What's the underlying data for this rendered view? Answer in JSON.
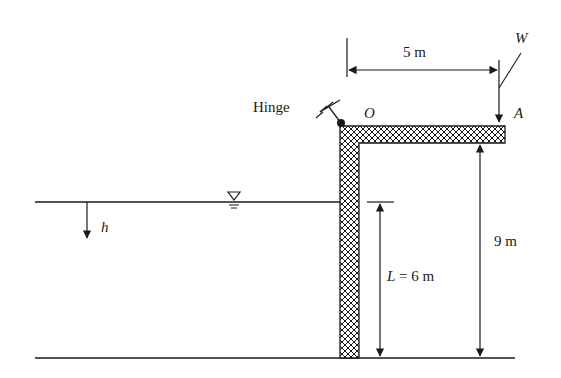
{
  "diagram": {
    "labels": {
      "hinge": "Hinge",
      "point_o": "O",
      "point_a": "A",
      "load": "W",
      "depth": "h",
      "span": "5 m",
      "height": "9 m",
      "gate_length_var": "L",
      "gate_length_val": " = 6 m"
    },
    "colors": {
      "ink": "#1a1a1a",
      "background": "#ffffff"
    }
  }
}
